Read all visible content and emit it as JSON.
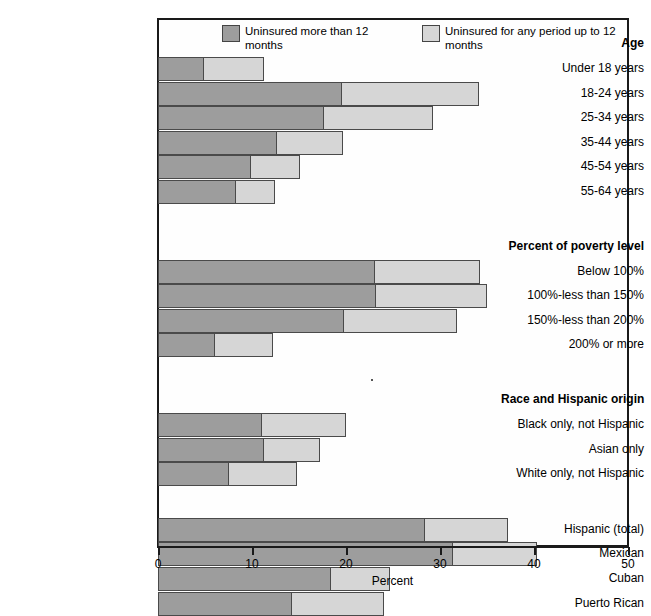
{
  "chart_data": {
    "type": "bar",
    "orientation": "horizontal",
    "stacked": true,
    "title": "",
    "xlabel": "Percent",
    "ylabel": "",
    "xlim": [
      0,
      50
    ],
    "xticks": [
      0,
      10,
      20,
      30,
      40,
      50
    ],
    "xtick_labels": [
      "0",
      "10",
      "20",
      "30",
      "40",
      "50"
    ],
    "grid": false,
    "legend_position": "top-inside",
    "series": [
      {
        "name": "Uninsured more than 12 months",
        "color": "#9d9d9d",
        "values": [
          4.9,
          19.6,
          17.7,
          12.7,
          9.9,
          8.3,
          23.1,
          23.2,
          19.8,
          6.1,
          11.1,
          11.3,
          7.6,
          28.4,
          31.4,
          18.4,
          14.3
        ]
      },
      {
        "name": "Uninsured for any period up to 12 months",
        "color": "#d6d6d6",
        "values": [
          6.4,
          14.6,
          11.6,
          7.0,
          5.2,
          4.1,
          11.2,
          11.8,
          12.0,
          6.1,
          8.9,
          5.9,
          7.2,
          8.8,
          8.9,
          6.3,
          9.7
        ]
      }
    ],
    "totals": [
      11.3,
      34.2,
      29.3,
      19.7,
      15.1,
      12.4,
      34.3,
      35.0,
      31.8,
      12.2,
      20.0,
      17.2,
      14.8,
      37.2,
      40.3,
      24.7,
      24.0
    ],
    "categories": [
      "Under 18 years",
      "18-24 years",
      "25-34 years",
      "35-44 years",
      "45-54 years",
      "55-64 years",
      "Below 100%",
      "100%-less than 150%",
      "150%-less than 200%",
      "200% or more",
      "Black only, not Hispanic",
      "Asian only",
      "White only, not Hispanic",
      "Hispanic (total)",
      "Mexican",
      "Cuban",
      "Puerto Rican"
    ]
  },
  "legend": {
    "entries": [
      {
        "label": "Uninsured more than 12 months",
        "swatch": "dark"
      },
      {
        "label": "Uninsured for any period up to 12 months",
        "swatch": "light"
      }
    ]
  },
  "axis": {
    "title": "Percent",
    "ticks": [
      {
        "label": "0"
      },
      {
        "label": "10"
      },
      {
        "label": "20"
      },
      {
        "label": "30"
      },
      {
        "label": "40"
      },
      {
        "label": "50"
      }
    ]
  },
  "groups": [
    {
      "heading": "Age",
      "rows": [
        {
          "label": "Under 18 years",
          "dark": 4.9,
          "total": 11.3
        },
        {
          "label": "18-24 years",
          "dark": 19.6,
          "total": 34.2
        },
        {
          "label": "25-34 years",
          "dark": 17.7,
          "total": 29.3
        },
        {
          "label": "35-44 years",
          "dark": 12.7,
          "total": 19.7
        },
        {
          "label": "45-54 years",
          "dark": 9.9,
          "total": 15.1
        },
        {
          "label": "55-64 years",
          "dark": 8.3,
          "total": 12.4
        }
      ]
    },
    {
      "heading": "Percent of poverty level",
      "rows": [
        {
          "label": "Below 100%",
          "dark": 23.1,
          "total": 34.3
        },
        {
          "label": "100%-less than 150%",
          "dark": 23.2,
          "total": 35.0
        },
        {
          "label": "150%-less than 200%",
          "dark": 19.8,
          "total": 31.8
        },
        {
          "label": "200% or more",
          "dark": 6.1,
          "total": 12.2
        }
      ]
    },
    {
      "heading": "Race and Hispanic origin",
      "rows": [
        {
          "label": "Black only, not Hispanic",
          "dark": 11.1,
          "total": 20.0
        },
        {
          "label": "Asian only",
          "dark": 11.3,
          "total": 17.2
        },
        {
          "label": "White only, not Hispanic",
          "dark": 7.6,
          "total": 14.8
        }
      ]
    },
    {
      "heading": "",
      "rows": [
        {
          "label": "Hispanic (total)",
          "dark": 28.4,
          "total": 37.2
        },
        {
          "label": "Mexican",
          "dark": 31.4,
          "total": 40.3
        },
        {
          "label": "Cuban",
          "dark": 18.4,
          "total": 24.7
        },
        {
          "label": "Puerto Rican",
          "dark": 14.3,
          "total": 24.0
        }
      ]
    }
  ]
}
